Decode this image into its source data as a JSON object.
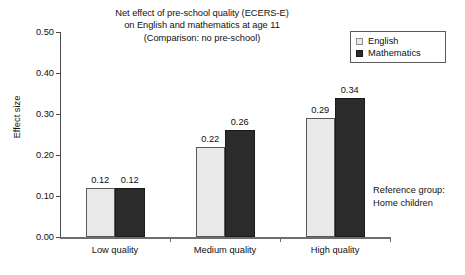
{
  "chart_data": {
    "type": "bar",
    "title": "Net effect of pre-school quality (ECERS-E) on English and mathematics at age 11 (Comparison: no pre-school)",
    "title_lines": [
      "Net effect of pre-school quality (ECERS-E)",
      "on English and mathematics at age 11",
      "(Comparison: no pre-school)"
    ],
    "xlabel": "",
    "ylabel": "Effect size",
    "categories": [
      "Low quality",
      "Medium quality",
      "High quality"
    ],
    "series": [
      {
        "name": "English",
        "values": [
          0.12,
          0.22,
          0.29
        ],
        "labels": [
          "0.12",
          "0.22",
          "0.29"
        ],
        "color": "#e9e9e9"
      },
      {
        "name": "Mathematics",
        "values": [
          0.12,
          0.26,
          0.34
        ],
        "labels": [
          "0.12",
          "0.26",
          "0.34"
        ],
        "color": "#2c2c2c"
      }
    ],
    "ylim": [
      0.0,
      0.5
    ],
    "ytick_values": [
      0.0,
      0.1,
      0.2,
      0.3,
      0.4,
      0.5
    ],
    "ytick_labels": [
      "0.00",
      "0.10",
      "0.20",
      "0.30",
      "0.40",
      "0.50"
    ],
    "grid": false,
    "legend_position": "top-right",
    "legend_entries": [
      "English",
      "Mathematics"
    ],
    "annotations": [
      {
        "name": "reference-group",
        "lines": [
          "Reference group:",
          "Home children"
        ]
      }
    ]
  }
}
